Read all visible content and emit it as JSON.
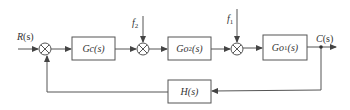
{
  "diagram": {
    "type": "control-system-block-diagram",
    "colors": {
      "line": "#555555",
      "text": "#333333",
      "background": "#ffffff"
    },
    "signals": {
      "input": {
        "name": "R",
        "arg": "(s)"
      },
      "output": {
        "name": "C",
        "arg": "(s)"
      },
      "disturbance_2": {
        "name": "f",
        "sub": "2"
      },
      "disturbance_1": {
        "name": "f",
        "sub": "1"
      }
    },
    "blocks": {
      "controller": {
        "name": "Gc",
        "arg": "(s)"
      },
      "plant_2": {
        "name": "Go",
        "sub": "2",
        "arg": "(s)"
      },
      "plant_1": {
        "name": "Go",
        "sub": "1",
        "arg": "(s)"
      },
      "feedback": {
        "name": "H",
        "arg": "(s)"
      }
    },
    "summing_junctions": [
      {
        "id": "sum-error",
        "inputs": [
          "R(s)",
          "feedback"
        ]
      },
      {
        "id": "sum-f2",
        "inputs": [
          "Gc(s) output",
          "f2"
        ]
      },
      {
        "id": "sum-f1",
        "inputs": [
          "Go2(s) output",
          "f1"
        ]
      }
    ]
  }
}
